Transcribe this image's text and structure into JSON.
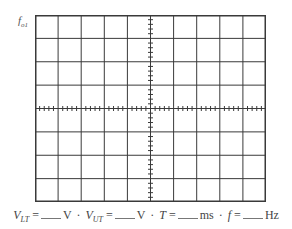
{
  "diagram": {
    "type": "oscilloscope-screen-grid",
    "corner_label": {
      "base": "f",
      "subscript": "o1"
    },
    "grid": {
      "columns": 10,
      "rows": 8,
      "minor_ticks_per_division": 5,
      "center_axes_ticked": true
    },
    "colors": {
      "grid_line": "#3a3a3a",
      "background": "#ffffff"
    }
  },
  "formula": {
    "items": [
      {
        "var": "V",
        "sub": "LT",
        "eq": "=",
        "unit": "V",
        "sep": "·"
      },
      {
        "var": "V",
        "sub": "UT",
        "eq": "=",
        "unit": "V",
        "sep": "·"
      },
      {
        "var": "T",
        "sub": "",
        "eq": "=",
        "unit": "ms",
        "sep": "·"
      },
      {
        "var": "f",
        "sub": "",
        "eq": "=",
        "unit": "Hz",
        "sep": ""
      }
    ]
  }
}
